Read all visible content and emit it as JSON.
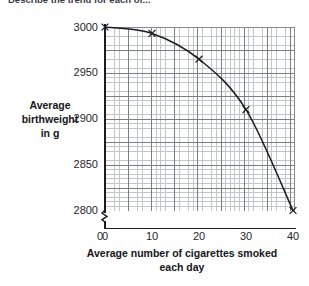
{
  "top_caption": "Describe the trend for each of...",
  "chart_data": {
    "type": "line",
    "title": "",
    "xlabel": "Average number of cigarettes smoked each day",
    "ylabel": "Average birthweight in g",
    "ylabel_lines": [
      "Average",
      "birthweight",
      "in g"
    ],
    "xlabel_lines": [
      "Average number of cigarettes smoked",
      "each day"
    ],
    "x": [
      0,
      10,
      20,
      30,
      40
    ],
    "values": [
      3000,
      2993,
      2965,
      2910,
      2800
    ],
    "series": [
      {
        "name": "Average birthweight",
        "x": [
          0,
          10,
          20,
          30,
          40
        ],
        "values": [
          3000,
          2993,
          2965,
          2910,
          2800
        ],
        "marker": "cross",
        "line": "smooth-curve",
        "color": "#1c1c22"
      }
    ],
    "xlim": [
      0,
      41
    ],
    "ylim": [
      2790,
      3000
    ],
    "xticks": [
      0,
      10,
      20,
      30,
      40
    ],
    "xtick_labels": [
      "0",
      "10",
      "20",
      "30",
      "40"
    ],
    "yticks": [
      2800,
      2850,
      2900,
      2950,
      3000
    ],
    "ytick_labels": [
      "2800",
      "2850",
      "2900",
      "2950",
      "3000"
    ],
    "y_origin_label": "0",
    "y_axis_break": true,
    "grid": true,
    "grid_minor": true,
    "legend": "none"
  },
  "colors": {
    "curve": "#1c1c22",
    "axis": "#1c1c22",
    "grid_major": "#7d7d85",
    "grid_minor": "#c4c4cb",
    "background": "#ffffff",
    "text": "#26262c"
  }
}
